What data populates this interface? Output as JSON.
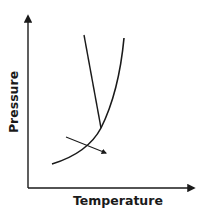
{
  "diagram": {
    "type": "phase-diagram-sketch",
    "x_axis_label": "Temperature",
    "y_axis_label": "Pressure",
    "colors": {
      "line": "#1a1a1a",
      "background": "#ffffff"
    },
    "elements": [
      {
        "name": "steep-line",
        "description": "nearly vertical line descending to the curve intersection"
      },
      {
        "name": "rising-curve",
        "description": "curve rising from lower-left, steepening to the upper right"
      },
      {
        "name": "direction-arrow",
        "description": "short arrow crossing the curve pointing down-right"
      }
    ]
  }
}
